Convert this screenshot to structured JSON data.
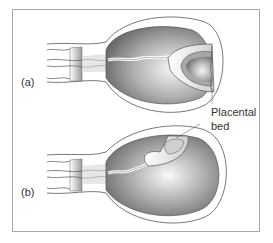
{
  "figure": {
    "panels": [
      {
        "id": "a",
        "label": "(a)"
      },
      {
        "id": "b",
        "label": "(b)"
      }
    ],
    "annotation": {
      "line1": "Placental",
      "line2": "bed"
    },
    "colors": {
      "frame": "#a8a8a8",
      "outline": "#555555",
      "cavity_dark": "#6e6e6e",
      "cavity_light": "#f4f4f4",
      "placenta_fill": "#e2e2e2"
    }
  }
}
